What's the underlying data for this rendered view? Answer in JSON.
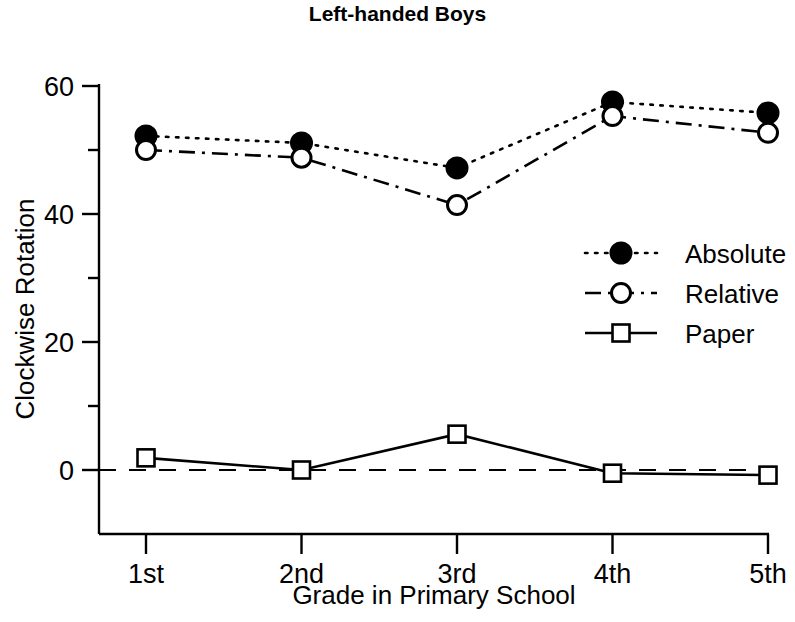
{
  "chart_data": {
    "type": "line",
    "title": "Left-handed Boys",
    "xlabel": "Grade in Primary School",
    "ylabel": "Clockwise Rotation",
    "categories": [
      "1st",
      "2nd",
      "3rd",
      "4th",
      "5th"
    ],
    "x_tick_labels": [
      "1st",
      "2nd",
      "3rd",
      "4th",
      "5th"
    ],
    "y_tick_labels": [
      "0",
      "20",
      "40",
      "60"
    ],
    "y_major_ticks": [
      0,
      20,
      40,
      60
    ],
    "y_minor_ticks": [
      10,
      30,
      50
    ],
    "ylim": [
      -10,
      62
    ],
    "grid": false,
    "legend_position": "center-right",
    "zero_reference_line": 0,
    "series": [
      {
        "name": "Absolute",
        "marker": "filled-circle",
        "linestyle": "dotted",
        "values": [
          52.2,
          51.1,
          47.2,
          57.5,
          55.8
        ]
      },
      {
        "name": "Relative",
        "marker": "open-circle",
        "linestyle": "dash-dot",
        "values": [
          50.0,
          48.8,
          41.4,
          55.3,
          52.7
        ]
      },
      {
        "name": "Paper",
        "marker": "open-square",
        "linestyle": "solid",
        "values": [
          1.9,
          0.0,
          5.6,
          -0.5,
          -0.8
        ]
      }
    ]
  },
  "legend": {
    "entries": [
      {
        "label": "Absolute"
      },
      {
        "label": "Relative"
      },
      {
        "label": "Paper"
      }
    ]
  },
  "colors": {
    "ink": "#000000",
    "background": "#ffffff"
  }
}
